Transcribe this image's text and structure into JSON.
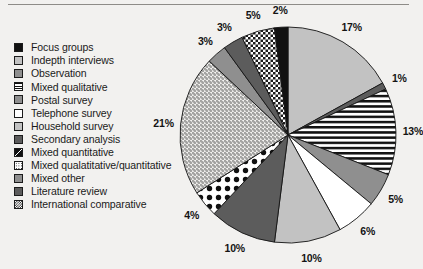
{
  "figure": {
    "background_color": "#f2f1ef",
    "rule_color": "#8e8c88"
  },
  "legend": {
    "items": [
      {
        "label": "Focus groups",
        "pattern": "solid-black",
        "swatch_color": "#111111"
      },
      {
        "label": "Indepth interviews",
        "pattern": "light-gray",
        "swatch_color": "#c2c2c2"
      },
      {
        "label": "Observation",
        "pattern": "medium-gray",
        "swatch_color": "#8f8f8f"
      },
      {
        "label": "Mixed qualitative",
        "pattern": "horizontal-stripes",
        "swatch_color": "#111111"
      },
      {
        "label": "Postal survey",
        "pattern": "medium-gray",
        "swatch_color": "#8f8f8f"
      },
      {
        "label": "Telephone survey",
        "pattern": "white",
        "swatch_color": "#ffffff"
      },
      {
        "label": "Household survey",
        "pattern": "light-gray",
        "swatch_color": "#a8a8a8"
      },
      {
        "label": "Secondary analysis",
        "pattern": "dark-gray",
        "swatch_color": "#5c5c5c"
      },
      {
        "label": "Mixed quantitative",
        "pattern": "quadrant-black",
        "swatch_color": "#111111"
      },
      {
        "label": "Mixed qualatitative/quantitative",
        "pattern": "fine-dots",
        "swatch_color": "#1d1d1d"
      },
      {
        "label": "Mixed other",
        "pattern": "medium-gray",
        "swatch_color": "#8f8f8f"
      },
      {
        "label": "Literature review",
        "pattern": "dark-gray",
        "swatch_color": "#5c5c5c"
      },
      {
        "label": "International comparative",
        "pattern": "checkerboard",
        "swatch_color": "#1b1b1b"
      }
    ]
  },
  "chart_data": {
    "type": "pie",
    "title": "",
    "start_angle_deg": 0,
    "direction": "clockwise",
    "units": "percent",
    "labels_shown": true,
    "legend_position": "left",
    "categories": [
      "Indepth interviews",
      "Observation",
      "Mixed qualitative",
      "Postal survey",
      "Telephone survey",
      "Household survey",
      "Secondary analysis",
      "Mixed quantitative",
      "Mixed qualatitative/quantitative",
      "Mixed other",
      "Literature review",
      "International comparative",
      "Focus groups"
    ],
    "values": [
      17,
      1,
      13,
      5,
      6,
      10,
      10,
      4,
      21,
      3,
      3,
      5,
      2
    ],
    "data_labels": [
      "17%",
      "1%",
      "13%",
      "5%",
      "6%",
      "10%",
      "10%",
      "4%",
      "21%",
      "3%",
      "3%",
      "5%",
      "2%"
    ],
    "slices": [
      {
        "label": "17%",
        "value": 17,
        "pattern": "light-gray",
        "category": "Indepth interviews"
      },
      {
        "label": "1%",
        "value": 1,
        "pattern": "dark-gray",
        "category": "Observation"
      },
      {
        "label": "13%",
        "value": 13,
        "pattern": "horizontal-stripes",
        "category": "Mixed qualitative"
      },
      {
        "label": "5%",
        "value": 5,
        "pattern": "medium-gray",
        "category": "Postal survey"
      },
      {
        "label": "6%",
        "value": 6,
        "pattern": "white",
        "category": "Telephone survey"
      },
      {
        "label": "10%",
        "value": 10,
        "pattern": "light-gray",
        "category": "Household survey"
      },
      {
        "label": "10%",
        "value": 10,
        "pattern": "dark-gray",
        "category": "Secondary analysis"
      },
      {
        "label": "4%",
        "value": 4,
        "pattern": "polka-dots",
        "category": "Mixed quantitative"
      },
      {
        "label": "21%",
        "value": 21,
        "pattern": "fine-speckle",
        "category": "Mixed qualatitative/quantitative"
      },
      {
        "label": "3%",
        "value": 3,
        "pattern": "medium-gray",
        "category": "Mixed other"
      },
      {
        "label": "3%",
        "value": 3,
        "pattern": "dark-gray",
        "category": "Literature review"
      },
      {
        "label": "5%",
        "value": 5,
        "pattern": "checkerboard",
        "category": "International comparative"
      },
      {
        "label": "2%",
        "value": 2,
        "pattern": "solid-black",
        "category": "Focus groups"
      }
    ]
  }
}
